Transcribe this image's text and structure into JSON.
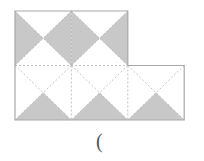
{
  "figure": {
    "rows": [
      {
        "name": "top-row",
        "squares": [
          {
            "shaded_triangles": [
              "left",
              "right"
            ]
          },
          {
            "shaded_triangles": [
              "left",
              "right"
            ]
          }
        ]
      },
      {
        "name": "bottom-row",
        "squares": [
          {
            "shaded_triangles": [
              "bottom"
            ]
          },
          {
            "shaded_triangles": [
              "bottom"
            ]
          },
          {
            "shaded_triangles": [
              "bottom"
            ]
          }
        ]
      }
    ],
    "colors": {
      "shade": "#c8c8c8",
      "outline": "#a8a8a8",
      "dashed": "#b4b4b4",
      "background": "#ffffff"
    }
  },
  "caption": {
    "text": "("
  }
}
